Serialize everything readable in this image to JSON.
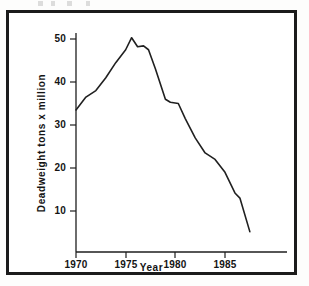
{
  "figure": {
    "background_color": "#ffffff",
    "frame_color": "#1b1b1b",
    "line_color": "#202020"
  },
  "chart_data": {
    "type": "line",
    "title": "",
    "xlabel": "Year",
    "ylabel": "Deadweight tons x million",
    "xlim": [
      1970,
      1988
    ],
    "ylim": [
      0,
      53
    ],
    "grid": false,
    "legend": null,
    "x_ticks": [
      1970,
      1975,
      1980,
      1985
    ],
    "x_tick_labels": [
      "1970",
      "1975",
      "1980",
      "1985"
    ],
    "y_ticks": [
      10,
      20,
      30,
      40,
      50
    ],
    "y_tick_labels": [
      "10",
      "20",
      "30",
      "40",
      "50"
    ],
    "series": [
      {
        "name": "Deadweight tons x million",
        "x": [
          1970,
          1971,
          1972,
          1973,
          1974,
          1975,
          1975.6,
          1976.2,
          1976.8,
          1977.3,
          1978,
          1979,
          1979.5,
          1980.3,
          1981,
          1982,
          1983,
          1984,
          1985,
          1986,
          1986.5,
          1987.5
        ],
        "values": [
          33.5,
          36.5,
          38.0,
          41.0,
          44.5,
          47.5,
          50.3,
          48.2,
          48.4,
          47.5,
          43.0,
          36.0,
          35.3,
          35.0,
          31.5,
          27.0,
          23.5,
          22.0,
          19.0,
          14.2,
          13.0,
          5.2
        ]
      }
    ]
  },
  "axis_labels": {
    "y_title": "Deadweight tons x million",
    "x_title": "Year"
  }
}
